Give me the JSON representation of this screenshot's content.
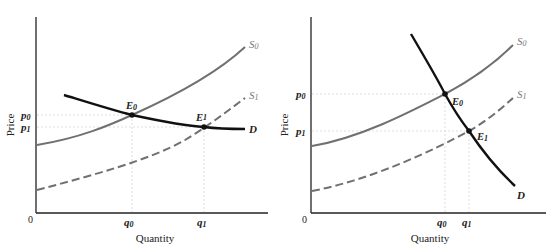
{
  "figure": {
    "panels": [
      {
        "id": "left",
        "description": "Elastic (flat) demand: supply shift lowers price slightly, raises quantity a lot",
        "axes": {
          "ylabel": "Price",
          "xlabel": "Quantity",
          "origin": "0"
        },
        "price_ticks": [
          "p0",
          "p1"
        ],
        "quantity_ticks": [
          "q0",
          "q1"
        ],
        "curves": {
          "s0": "S0",
          "s1": "S1",
          "d": "D"
        },
        "points": {
          "e0": "E0",
          "e1": "E1"
        }
      },
      {
        "id": "right",
        "description": "Inelastic (steep) demand: supply shift lowers price a lot, raises quantity slightly",
        "axes": {
          "ylabel": "Price",
          "xlabel": "Quantity",
          "origin": "0"
        },
        "price_ticks": [
          "p0",
          "p1"
        ],
        "quantity_ticks": [
          "q0",
          "q1"
        ],
        "curves": {
          "s0": "S0",
          "s1": "S1",
          "d": "D"
        },
        "points": {
          "e0": "E0",
          "e1": "E1"
        }
      }
    ],
    "colors": {
      "supply": "#6e6e6e",
      "demand": "#111111",
      "axis": "#222222",
      "guide": "#cccccc"
    }
  },
  "labels": {
    "price": "Price",
    "quantity": "Quantity",
    "origin": "0",
    "p": "p",
    "q": "q",
    "e": "E",
    "s": "S",
    "d": "D",
    "sub0": "0",
    "sub1": "1"
  }
}
